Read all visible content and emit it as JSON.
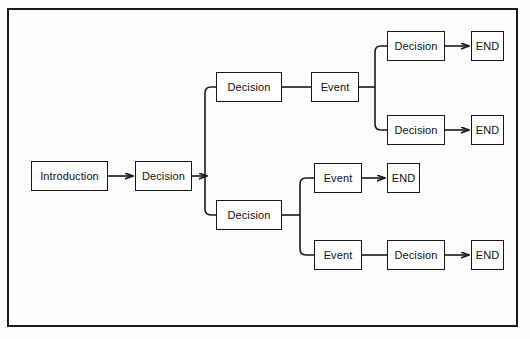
{
  "diagram": {
    "type": "flowchart",
    "orientation": "left-to-right",
    "frame": {
      "border_color": "#1b1b1b",
      "background": "#fdfdfd"
    },
    "node_style": {
      "fill": "#ffffff",
      "stroke": "#181818"
    },
    "nodes": [
      {
        "id": "n1",
        "label": "Introduction",
        "kind": "start",
        "x": 31,
        "y": 161,
        "w": 77,
        "h": 30
      },
      {
        "id": "n2",
        "label": "Decision",
        "kind": "decision",
        "x": 135,
        "y": 161,
        "w": 57,
        "h": 30
      },
      {
        "id": "n3",
        "label": "Decision",
        "kind": "decision",
        "x": 216,
        "y": 72,
        "w": 66,
        "h": 30
      },
      {
        "id": "n4",
        "label": "Event",
        "kind": "event",
        "x": 311,
        "y": 72,
        "w": 48,
        "h": 30
      },
      {
        "id": "n5",
        "label": "Decision",
        "kind": "decision",
        "x": 387,
        "y": 31,
        "w": 58,
        "h": 30
      },
      {
        "id": "n6",
        "label": "END",
        "kind": "end",
        "x": 471,
        "y": 31,
        "w": 33,
        "h": 30
      },
      {
        "id": "n7",
        "label": "Decision",
        "kind": "decision",
        "x": 387,
        "y": 115,
        "w": 58,
        "h": 30
      },
      {
        "id": "n8",
        "label": "END",
        "kind": "end",
        "x": 471,
        "y": 115,
        "w": 33,
        "h": 30
      },
      {
        "id": "n9",
        "label": "Decision",
        "kind": "decision",
        "x": 216,
        "y": 200,
        "w": 66,
        "h": 30
      },
      {
        "id": "n10",
        "label": "Event",
        "kind": "event",
        "x": 314,
        "y": 163,
        "w": 48,
        "h": 30
      },
      {
        "id": "n11",
        "label": "END",
        "kind": "end",
        "x": 387,
        "y": 163,
        "w": 33,
        "h": 30
      },
      {
        "id": "n12",
        "label": "Event",
        "kind": "event",
        "x": 314,
        "y": 240,
        "w": 48,
        "h": 30
      },
      {
        "id": "n13",
        "label": "Decision",
        "kind": "decision",
        "x": 387,
        "y": 240,
        "w": 58,
        "h": 30
      },
      {
        "id": "n14",
        "label": "END",
        "kind": "end",
        "x": 471,
        "y": 240,
        "w": 33,
        "h": 30
      }
    ],
    "edges": [
      {
        "from": "n1",
        "to": "n2",
        "arrow": true,
        "shape": "straight"
      },
      {
        "from": "n2",
        "to": "n3",
        "arrow": true,
        "shape": "elbow-up"
      },
      {
        "from": "n2",
        "to": "n9",
        "arrow": false,
        "shape": "elbow-down"
      },
      {
        "from": "n3",
        "to": "n4",
        "arrow": false,
        "shape": "straight"
      },
      {
        "from": "n4",
        "to": "n5",
        "arrow": false,
        "shape": "elbow-up"
      },
      {
        "from": "n4",
        "to": "n7",
        "arrow": false,
        "shape": "elbow-down"
      },
      {
        "from": "n5",
        "to": "n6",
        "arrow": true,
        "shape": "straight"
      },
      {
        "from": "n7",
        "to": "n8",
        "arrow": true,
        "shape": "straight"
      },
      {
        "from": "n9",
        "to": "n10",
        "arrow": false,
        "shape": "elbow-up"
      },
      {
        "from": "n9",
        "to": "n12",
        "arrow": false,
        "shape": "elbow-down"
      },
      {
        "from": "n10",
        "to": "n11",
        "arrow": true,
        "shape": "straight"
      },
      {
        "from": "n12",
        "to": "n13",
        "arrow": false,
        "shape": "straight"
      },
      {
        "from": "n13",
        "to": "n14",
        "arrow": true,
        "shape": "straight"
      }
    ]
  }
}
